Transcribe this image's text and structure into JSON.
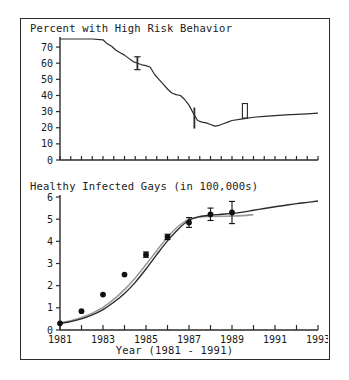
{
  "figure": {
    "background": "#ffffff",
    "frame_color": "#2b2b2b",
    "line_color": "#2b2b2b",
    "secondary_line_color": "#9a9a9a",
    "marker_color": "#111111"
  },
  "xaxis_title": "Year (1981 - 1991)",
  "chart_data": [
    {
      "type": "line",
      "id": "high-risk-behavior",
      "title": "Percent with High Risk Behavior",
      "xlabel": "",
      "ylabel": "",
      "xlim": [
        1981,
        1993
      ],
      "ylim": [
        0,
        75
      ],
      "yticks": [
        0,
        10,
        20,
        30,
        40,
        50,
        60,
        70
      ],
      "ytick_labels": [
        "0",
        "10",
        "20",
        "30",
        "40",
        "50",
        "60",
        "70"
      ],
      "xticks": [
        1981,
        1981.5,
        1982,
        1982.5,
        1983,
        1983.5,
        1984,
        1984.5,
        1985,
        1985.5,
        1986,
        1986.5,
        1987,
        1987.5,
        1988,
        1988.5,
        1989,
        1989.5,
        1990,
        1990.5,
        1991,
        1991.5,
        1992,
        1992.5,
        1993
      ],
      "grid": false,
      "legend": "none",
      "series": [
        {
          "name": "Percent with high risk behavior",
          "x": [
            1981.0,
            1981.5,
            1982.0,
            1982.5,
            1983.0,
            1983.2,
            1983.4,
            1983.6,
            1983.8,
            1984.0,
            1984.2,
            1984.4,
            1984.6,
            1984.8,
            1985.0,
            1985.2,
            1985.4,
            1985.6,
            1985.8,
            1986.0,
            1986.2,
            1986.4,
            1986.6,
            1986.8,
            1987.0,
            1987.2,
            1987.4,
            1987.6,
            1987.8,
            1988.0,
            1988.2,
            1988.4,
            1988.6,
            1988.8,
            1989.0,
            1989.5,
            1990.0,
            1990.5,
            1991.0,
            1991.5,
            1992.0,
            1992.5,
            1993.0
          ],
          "y": [
            75.0,
            75.0,
            75.0,
            75.0,
            74.5,
            72.0,
            70.5,
            68.0,
            66.5,
            65.0,
            63.0,
            61.0,
            60.0,
            59.0,
            58.5,
            57.5,
            53.0,
            50.0,
            47.0,
            44.0,
            41.5,
            40.5,
            40.0,
            37.5,
            34.0,
            29.0,
            24.5,
            23.5,
            23.0,
            22.0,
            21.0,
            21.5,
            22.5,
            23.5,
            24.5,
            25.5,
            26.5,
            27.0,
            27.5,
            28.0,
            28.3,
            28.6,
            29.0
          ]
        }
      ],
      "error_bars": [
        {
          "x": 1984.6,
          "y": 60.0,
          "yerr_low": 4.0,
          "yerr_high": 4.0,
          "style": "capped"
        },
        {
          "x": 1987.25,
          "y": 27.5,
          "yerr_low": 8.0,
          "yerr_high": 5.0,
          "style": "plain"
        },
        {
          "x": 1989.6,
          "y": 29.5,
          "yerr_low": 3.5,
          "yerr_high": 5.5,
          "style": "box"
        }
      ]
    },
    {
      "type": "line",
      "id": "healthy-infected-gays",
      "title": "Healthy Infected Gays (in 100,000s)",
      "xlabel": "Year (1981 - 1991)",
      "ylabel": "",
      "xlim": [
        1981,
        1993
      ],
      "ylim": [
        0,
        6
      ],
      "yticks": [
        0,
        1,
        2,
        3,
        4,
        5,
        6
      ],
      "ytick_labels": [
        "0",
        "1",
        "2",
        "3",
        "4",
        "5",
        "6"
      ],
      "xticks": [
        1981,
        1982,
        1983,
        1984,
        1985,
        1986,
        1987,
        1988,
        1989,
        1990,
        1991,
        1992,
        1993
      ],
      "xtick_labels": [
        "1981",
        "",
        "1983",
        "",
        "1985",
        "",
        "1987",
        "",
        "1989",
        "",
        "1991",
        "",
        "1993"
      ],
      "grid": false,
      "legend": "none",
      "series": [
        {
          "name": "Model (black)",
          "color": "#2b2b2b",
          "x": [
            1981.0,
            1981.5,
            1982.0,
            1982.5,
            1983.0,
            1983.5,
            1984.0,
            1984.5,
            1985.0,
            1985.5,
            1986.0,
            1986.5,
            1987.0,
            1987.5,
            1988.0,
            1988.5,
            1989.0,
            1989.5,
            1990.0,
            1990.5,
            1991.0,
            1991.5,
            1992.0,
            1992.5,
            1993.0
          ],
          "y": [
            0.3,
            0.38,
            0.5,
            0.68,
            0.92,
            1.25,
            1.65,
            2.15,
            2.75,
            3.4,
            4.02,
            4.55,
            4.95,
            5.12,
            5.18,
            5.22,
            5.26,
            5.32,
            5.4,
            5.48,
            5.56,
            5.63,
            5.7,
            5.76,
            5.82
          ]
        },
        {
          "name": "Model (gray)",
          "color": "#9a9a9a",
          "x": [
            1981.0,
            1981.5,
            1982.0,
            1982.5,
            1983.0,
            1983.5,
            1984.0,
            1984.5,
            1985.0,
            1985.5,
            1986.0,
            1986.5,
            1987.0,
            1987.5,
            1988.0,
            1988.5,
            1989.0,
            1989.5,
            1990.0
          ],
          "y": [
            0.32,
            0.42,
            0.56,
            0.76,
            1.02,
            1.38,
            1.82,
            2.35,
            2.95,
            3.58,
            4.18,
            4.68,
            5.0,
            5.1,
            5.12,
            5.13,
            5.14,
            5.16,
            5.2
          ]
        }
      ],
      "data_points": [
        {
          "x": 1981,
          "y": 0.3,
          "yerr": 0.0
        },
        {
          "x": 1982,
          "y": 0.85,
          "yerr": 0.0
        },
        {
          "x": 1983,
          "y": 1.6,
          "yerr": 0.0
        },
        {
          "x": 1984,
          "y": 2.5,
          "yerr": 0.0
        },
        {
          "x": 1985,
          "y": 3.4,
          "yerr": 0.12
        },
        {
          "x": 1986,
          "y": 4.2,
          "yerr": 0.12
        },
        {
          "x": 1987,
          "y": 4.85,
          "yerr": 0.22
        },
        {
          "x": 1988,
          "y": 5.22,
          "yerr": 0.28
        },
        {
          "x": 1989,
          "y": 5.3,
          "yerr": 0.5
        }
      ]
    }
  ]
}
